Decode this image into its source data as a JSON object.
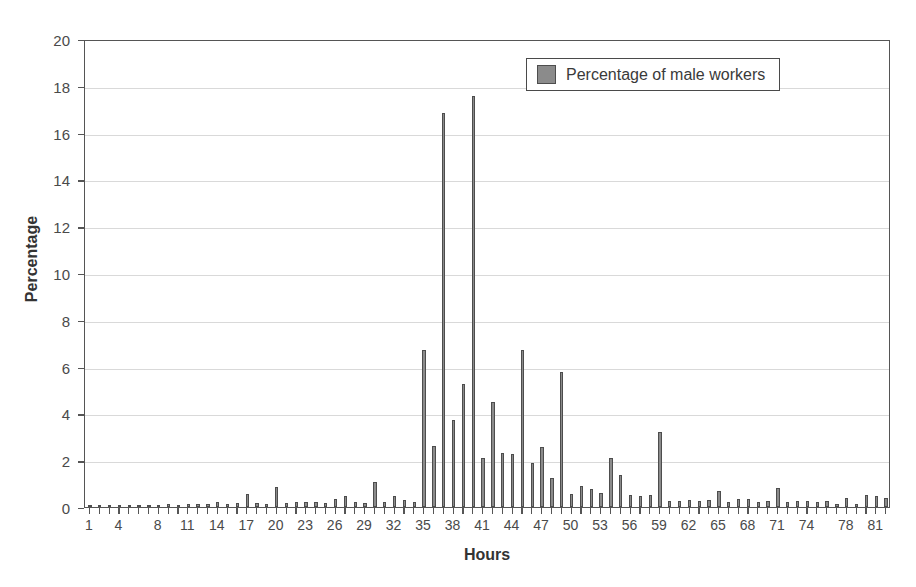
{
  "chart_data": {
    "type": "bar",
    "title": "",
    "xlabel": "Hours",
    "ylabel": "Percentage",
    "ylim": [
      0,
      20
    ],
    "ytick_step": 2,
    "yticks": [
      0,
      2,
      4,
      6,
      8,
      10,
      12,
      14,
      16,
      18,
      20
    ],
    "xticks_labeled": [
      1,
      4,
      8,
      11,
      14,
      17,
      20,
      23,
      26,
      29,
      32,
      35,
      38,
      41,
      44,
      47,
      50,
      53,
      56,
      59,
      62,
      65,
      68,
      71,
      74,
      78,
      81
    ],
    "xlim": [
      1,
      82
    ],
    "grid": "horizontal",
    "legend_position": "top-right",
    "series": [
      {
        "name": "Percentage of male workers",
        "color": "#8b8b8b",
        "categories": [
          1,
          2,
          3,
          4,
          5,
          6,
          7,
          8,
          9,
          10,
          11,
          12,
          13,
          14,
          15,
          16,
          17,
          18,
          19,
          20,
          21,
          22,
          23,
          24,
          25,
          26,
          27,
          28,
          29,
          30,
          31,
          32,
          33,
          34,
          35,
          36,
          37,
          38,
          39,
          40,
          41,
          42,
          43,
          44,
          45,
          46,
          47,
          48,
          49,
          50,
          51,
          52,
          53,
          54,
          55,
          56,
          57,
          58,
          59,
          60,
          61,
          62,
          63,
          64,
          65,
          66,
          67,
          68,
          69,
          70,
          71,
          72,
          73,
          74,
          75,
          76,
          77,
          78,
          79,
          80,
          81,
          82
        ],
        "values": [
          0.05,
          0.06,
          0.06,
          0.07,
          0.07,
          0.08,
          0.08,
          0.1,
          0.12,
          0.1,
          0.12,
          0.12,
          0.15,
          0.2,
          0.15,
          0.18,
          0.55,
          0.18,
          0.15,
          0.85,
          0.18,
          0.22,
          0.2,
          0.2,
          0.18,
          0.35,
          0.45,
          0.2,
          0.18,
          1.05,
          0.2,
          0.45,
          0.3,
          0.22,
          6.7,
          2.6,
          16.85,
          3.7,
          5.25,
          17.55,
          2.1,
          4.5,
          2.3,
          2.25,
          6.7,
          1.9,
          2.55,
          1.25,
          5.75,
          0.55,
          0.9,
          0.75,
          0.6,
          2.1,
          1.35,
          0.5,
          0.45,
          0.5,
          3.2,
          0.25,
          0.25,
          0.3,
          0.25,
          0.3,
          0.7,
          0.2,
          0.35,
          0.35,
          0.2,
          0.25,
          0.8,
          0.2,
          0.25,
          0.25,
          0.2,
          0.25,
          0.15,
          0.4,
          0.15,
          0.5,
          0.45,
          0.4
        ]
      }
    ]
  },
  "legend": {
    "entries": [
      {
        "label": "Percentage of male workers",
        "color": "#8b8b8b"
      }
    ]
  },
  "axes": {
    "y_title": "Percentage",
    "x_title": "Hours"
  }
}
